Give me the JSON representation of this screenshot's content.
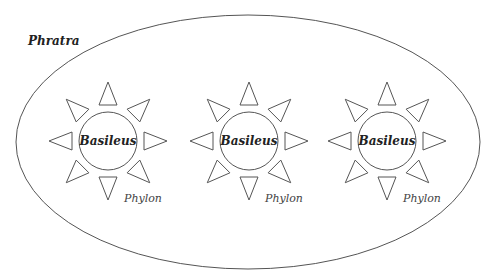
{
  "diagram": {
    "outer": {
      "label": "Phratra",
      "cx": 248,
      "cy": 142,
      "rx": 232,
      "ry": 127
    },
    "units": [
      {
        "cx": 108,
        "cy": 141,
        "core_label": "Basileus",
        "sub_label": "Phylon"
      },
      {
        "cx": 249,
        "cy": 141,
        "core_label": "Basileus",
        "sub_label": "Phylon"
      },
      {
        "cx": 387,
        "cy": 141,
        "core_label": "Basileus",
        "sub_label": "Phylon"
      }
    ],
    "core_radius": 29,
    "ray_count": 8,
    "stroke_color": "#555555",
    "text_color": "#222222"
  }
}
